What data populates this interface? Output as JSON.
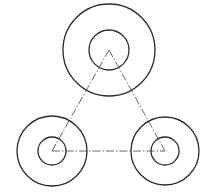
{
  "drawing": {
    "width": 209,
    "height": 196,
    "background": "#ffffff",
    "colors": {
      "circle_stroke": "#2b2b2b",
      "centerline_stroke": "#555555"
    },
    "parts": [
      {
        "name": "top-boss",
        "center": [
          109,
          50
        ],
        "outer_radius": 46,
        "inner_radius": 20
      },
      {
        "name": "bottom-left-boss",
        "center": [
          52,
          151
        ],
        "outer_radius": 35,
        "inner_radius": 14
      },
      {
        "name": "bottom-right-boss",
        "center": [
          165,
          151
        ],
        "outer_radius": 34,
        "inner_radius": 14
      }
    ],
    "centerlines": [
      {
        "name": "left-edge",
        "from": [
          109,
          50
        ],
        "to": [
          52,
          151
        ]
      },
      {
        "name": "right-edge",
        "from": [
          109,
          50
        ],
        "to": [
          165,
          151
        ]
      },
      {
        "name": "base-edge",
        "from": [
          52,
          151
        ],
        "to": [
          165,
          151
        ]
      }
    ],
    "centerline_style": "dash-dot"
  }
}
